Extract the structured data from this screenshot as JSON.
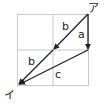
{
  "diagram": {
    "type": "vector-diagram",
    "grid": {
      "rows": 2,
      "cols": 2,
      "color": "#c8c8c8"
    },
    "points": {
      "start": {
        "label": "ア"
      },
      "end": {
        "label": "イ"
      }
    },
    "vectors": [
      {
        "label": "a",
        "from": "ア",
        "direction": "down"
      },
      {
        "label": "b",
        "from": "ア",
        "direction": "down-left",
        "segment": 1
      },
      {
        "label": "b",
        "from": "grid-center",
        "direction": "down-left",
        "segment": 2
      },
      {
        "label": "c",
        "from": "end-of-a",
        "to": "イ"
      }
    ],
    "line_color": "#222222"
  }
}
